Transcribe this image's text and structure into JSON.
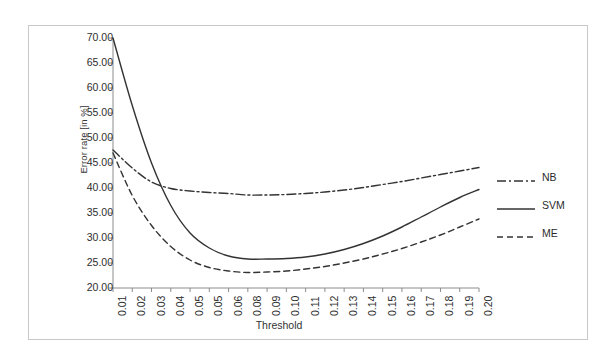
{
  "figure": {
    "y_axis_title": "Error rate [in %]",
    "x_axis_title": "Threshold"
  },
  "legend": {
    "position": "right",
    "items": [
      {
        "label": "NB",
        "style": "dash-dot",
        "color": "#333333"
      },
      {
        "label": "SVM",
        "style": "solid",
        "color": "#333333"
      },
      {
        "label": "ME",
        "style": "dashed",
        "color": "#333333"
      }
    ]
  },
  "chart_data": {
    "type": "line",
    "title": "",
    "subtitle": "",
    "xlabel": "Threshold",
    "ylabel": "Error rate [in %]",
    "grid": false,
    "legend_position": "right",
    "categories": [
      "0.01",
      "0.02",
      "0.03",
      "0.04",
      "0.05",
      "0.05",
      "0.06",
      "0.08",
      "0.09",
      "0.10",
      "0.11",
      "0.12",
      "0.13",
      "0.14",
      "0.15",
      "0.16",
      "0.17",
      "0.18",
      "0.19",
      "0.20"
    ],
    "xlim": [
      0,
      19
    ],
    "ylim": [
      20,
      70
    ],
    "ytick_labels": [
      "70.00",
      "65.00",
      "60.00",
      "55.00",
      "50.00",
      "45.00",
      "40.00",
      "35.00",
      "30.00",
      "25.00",
      "20.00"
    ],
    "ytick_values": [
      70,
      65,
      60,
      55,
      50,
      45,
      40,
      35,
      30,
      25,
      20
    ],
    "series": [
      {
        "name": "NB",
        "style": "dash-dot",
        "color": "#333333",
        "values": [
          47.6,
          44.0,
          41.2,
          39.9,
          39.4,
          39.1,
          38.9,
          38.6,
          38.6,
          38.7,
          38.9,
          39.2,
          39.6,
          40.1,
          40.7,
          41.3,
          42.0,
          42.7,
          43.4,
          44.1
        ]
      },
      {
        "name": "SVM",
        "style": "solid",
        "color": "#333333",
        "values": [
          70.0,
          56.5,
          45.0,
          36.5,
          31.0,
          28.0,
          26.4,
          25.8,
          25.8,
          25.9,
          26.2,
          26.8,
          27.7,
          28.9,
          30.4,
          32.2,
          34.2,
          36.2,
          38.1,
          39.7
        ]
      },
      {
        "name": "ME",
        "style": "dashed",
        "color": "#333333",
        "values": [
          47.0,
          38.5,
          32.5,
          28.3,
          25.6,
          24.1,
          23.4,
          23.1,
          23.2,
          23.4,
          23.8,
          24.3,
          25.0,
          25.8,
          26.8,
          27.9,
          29.2,
          30.6,
          32.2,
          33.8
        ]
      }
    ]
  }
}
